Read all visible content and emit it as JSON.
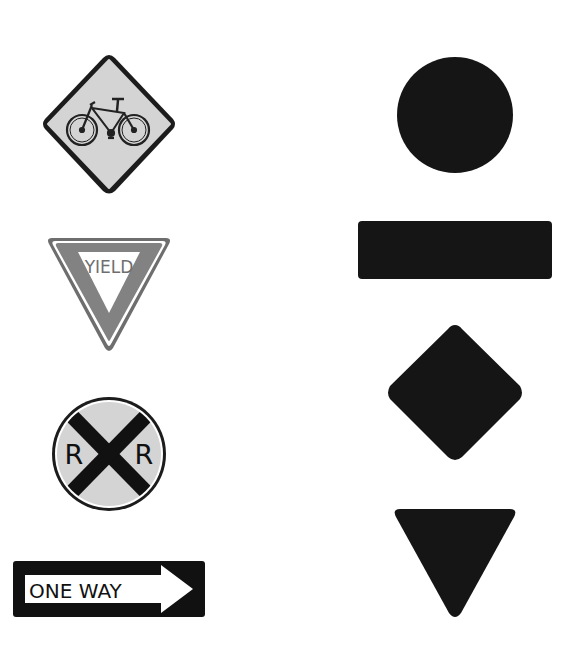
{
  "worksheet": {
    "left_column": {
      "signs": [
        {
          "id": "bicycle-crossing",
          "shape": "diamond",
          "icon": "bicycle-icon",
          "text": ""
        },
        {
          "id": "yield",
          "shape": "inverted-triangle",
          "text": "YIELD"
        },
        {
          "id": "railroad-crossing",
          "shape": "circle",
          "text_left": "R",
          "text_right": "R",
          "icon": "crossbuck-x-icon"
        },
        {
          "id": "one-way",
          "shape": "rectangle",
          "text": "ONE WAY",
          "icon": "arrow-right-icon"
        }
      ]
    },
    "right_column": {
      "shapes": [
        {
          "id": "circle-silhouette",
          "shape": "circle"
        },
        {
          "id": "rectangle-silhouette",
          "shape": "rectangle"
        },
        {
          "id": "diamond-silhouette",
          "shape": "diamond"
        },
        {
          "id": "triangle-silhouette",
          "shape": "inverted-triangle"
        }
      ]
    },
    "colors": {
      "background": "#ffffff",
      "sign_face": "#d4d4d4",
      "sign_border": "#1a1a1a",
      "yield_band": "#7d7d7d",
      "silhouette": "#151515"
    }
  }
}
